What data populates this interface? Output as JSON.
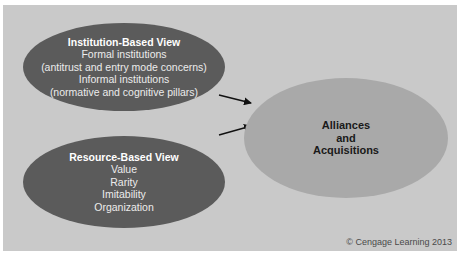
{
  "diagram": {
    "nodes": [
      {
        "id": "institution",
        "title": "Institution-Based View",
        "lines": [
          "Formal institutions",
          "(antitrust and entry mode concerns)",
          "Informal institutions",
          "(normative and cognitive pillars)"
        ]
      },
      {
        "id": "resource",
        "title": "Resource-Based View",
        "lines": [
          "Value",
          "Rarity",
          "Imitability",
          "Organization"
        ]
      },
      {
        "id": "outcome",
        "title_lines": [
          "Alliances",
          "and",
          "Acquisitions"
        ]
      }
    ],
    "edges": [
      {
        "from": "institution",
        "to": "outcome"
      },
      {
        "from": "resource",
        "to": "outcome"
      }
    ],
    "credit": "© Cengage Learning 2013"
  },
  "colors": {
    "background": "#c9c9c9",
    "dark_ellipse": "#5b5b5b",
    "light_ellipse": "#a9a9a9",
    "arrow": "#111111"
  }
}
